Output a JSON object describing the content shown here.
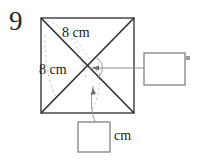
{
  "problem": {
    "number": "9",
    "figure_name": "square-with-diagonals"
  },
  "labels": {
    "diagonal_top": "8 cm",
    "diagonal_left": "8 cm",
    "unit_bottom": "cm"
  },
  "answer_boxes": {
    "right": {
      "value": "",
      "placeholder": ""
    },
    "bottom": {
      "value": "",
      "placeholder": ""
    }
  },
  "colors": {
    "ink": "#1b1b1b",
    "outline": "#3b3b3b",
    "box_border": "#8a8a8a",
    "faint_pencil": "#c8c6c4",
    "leader": "#8f8f8f"
  }
}
